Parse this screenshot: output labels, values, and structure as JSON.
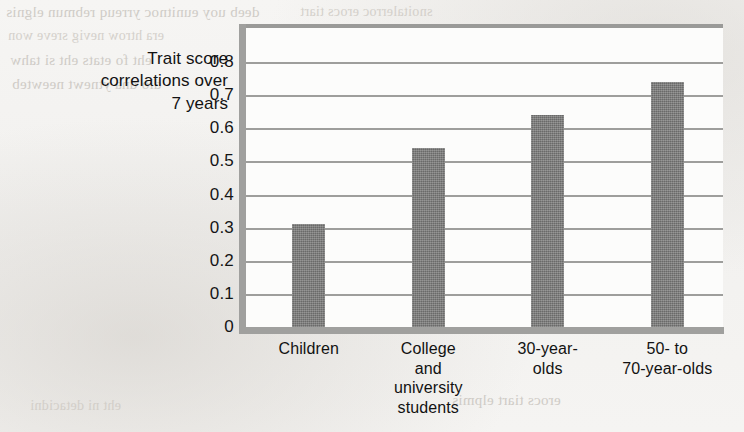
{
  "chart_data": {
    "type": "bar",
    "title": "",
    "ylabel": "Trait score correlations over 7 years",
    "ylabel_lines": [
      "Trait score",
      "correlations over",
      "7 years"
    ],
    "xlabel": "",
    "categories": [
      "Children",
      "College and university students",
      "30-year-olds",
      "50- to 70-year-olds"
    ],
    "category_lines": [
      [
        "Children"
      ],
      [
        "College",
        "and",
        "university",
        "students"
      ],
      [
        "30-year-",
        "olds"
      ],
      [
        "50- to",
        "70-year-olds"
      ]
    ],
    "values": [
      0.31,
      0.54,
      0.64,
      0.74
    ],
    "ylim": [
      0,
      0.8
    ],
    "ytick_labels": [
      "0.8",
      "0.7",
      "0.6",
      "0.5",
      "0.4",
      "0.3",
      "0.2",
      "0.1",
      "0"
    ],
    "ytick_values": [
      0.8,
      0.7,
      0.6,
      0.5,
      0.4,
      0.3,
      0.2,
      0.1,
      0
    ],
    "grid": true,
    "legend": false,
    "bar_color": "#797978",
    "axis_color": "#a0a09e",
    "grid_color": "#9e9e9c",
    "plot_background": "#fcfcfb",
    "page_background": "#f4f3f1"
  },
  "background_bleed": [
    {
      "text": "deeb  uoy eunitnoc yrreuq rebmun elgnis",
      "x": 6,
      "y": 4,
      "flip": true
    },
    {
      "text": "era htrow nevig sreve won",
      "x": 8,
      "y": 28,
      "flip": true
    },
    {
      "text": "eht fo etats eht si tahw",
      "x": 10,
      "y": 52,
      "flip": true
    },
    {
      "text": "dlo dna ytnewt neewteb",
      "x": 12,
      "y": 76,
      "flip": true
    },
    {
      "text": "snoitalerroc erocs tiart",
      "x": 300,
      "y": 4,
      "flip": true
    },
    {
      "text": "era stluser eseht woh",
      "x": 420,
      "y": 26,
      "flip": true
    },
    {
      "text": "eroces tiart elpmis a",
      "x": 430,
      "y": 96,
      "flip": true
    },
    {
      "text": "ni detroper saw ti sa",
      "x": 425,
      "y": 120,
      "flip": true
    },
    {
      "text": "erehw sesac eht ni",
      "x": 432,
      "y": 144,
      "flip": true
    },
    {
      "text": "ecnereffid a si ereht",
      "x": 428,
      "y": 168,
      "flip": true
    },
    {
      "text": "yrev a si siht taht",
      "x": 440,
      "y": 192,
      "flip": true
    },
    {
      "text": "noitalerroc gnorts",
      "x": 444,
      "y": 216,
      "flip": true
    },
    {
      "text": "erocs tiart elpmis",
      "x": 452,
      "y": 392,
      "flip": true
    },
    {
      "text": "eht ni detacidni",
      "x": 30,
      "y": 398,
      "flip": true
    }
  ]
}
